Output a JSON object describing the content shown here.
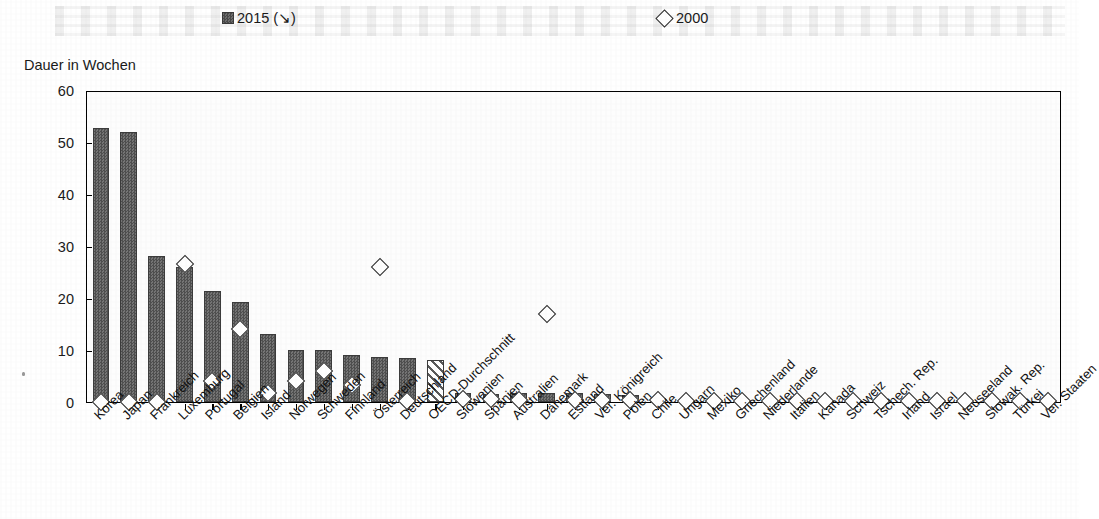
{
  "axis_title": "Dauer in Wochen",
  "legend": {
    "series_2015_label": "2015 (↘)",
    "series_2000_label": "2000",
    "marker_2015": "filled-square",
    "marker_2000": "open-diamond"
  },
  "colors": {
    "bar_fill": "#5f5f5f",
    "bar_edge": "#3c3c3c",
    "diamond_edge": "#2b2b2b",
    "diamond_fill": "#ffffff",
    "axis": "#000000",
    "highlight_bar_pattern": "diagonal-hatch"
  },
  "chart_data": {
    "type": "bar",
    "title": "",
    "subtitle": "",
    "xlabel": "",
    "ylabel": "Dauer in Wochen",
    "ylim": [
      0,
      60
    ],
    "yticks": [
      0,
      10,
      20,
      30,
      40,
      50,
      60
    ],
    "grid": false,
    "legend_position": "top",
    "highlight_category": "OECD-Durchschnitt",
    "categories": [
      "Korea",
      "Japan",
      "Frankreich",
      "Luxemburg",
      "Portugal",
      "Belgien",
      "Island",
      "Norwegen",
      "Schweden",
      "Finnland",
      "Österreich",
      "Deutschland",
      "OECD-Durchschnitt",
      "Slowenien",
      "Spanien",
      "Australien",
      "Dänemark",
      "Estland",
      "Ver. Königreich",
      "Polen",
      "Chile",
      "Ungarn",
      "Mexiko",
      "Griechenland",
      "Niederlande",
      "Italien",
      "Kanada",
      "Schweiz",
      "Tschech. Rep.",
      "Irland",
      "Israel",
      "Neuseeland",
      "Slowak. Rep.",
      "Türkei",
      "Ver. Staaten"
    ],
    "series": [
      {
        "name": "2015 (↘)",
        "type": "bar",
        "values": [
          52.7,
          52.0,
          28.0,
          26.0,
          21.3,
          19.3,
          13.0,
          10.0,
          10.0,
          9.0,
          8.6,
          8.5,
          8.0,
          1.8,
          1.6,
          1.7,
          1.7,
          1.7,
          1.5,
          1.4,
          0.7,
          0.2,
          0.1,
          0,
          0,
          0,
          0,
          0,
          0,
          0,
          0,
          0,
          0,
          0,
          0
        ]
      },
      {
        "name": "2000",
        "type": "scatter",
        "marker": "diamond",
        "values": [
          0,
          0,
          0,
          26.5,
          4.0,
          14.0,
          1.7,
          4.0,
          6.0,
          3.2,
          26.0,
          0.2,
          null,
          0.5,
          0.5,
          0.4,
          17.0,
          0.4,
          0.3,
          0.3,
          0.3,
          0.2,
          0.2,
          0.2,
          0.2,
          0.2,
          0.2,
          0.2,
          0.2,
          0.2,
          0.2,
          0.2,
          0.2,
          0.2,
          0.2
        ]
      }
    ]
  }
}
